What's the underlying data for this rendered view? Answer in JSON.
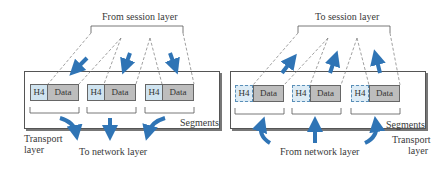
{
  "left_panel": {
    "top_label": "From session layer",
    "bottom_label": "To network layer",
    "segments_label": "Segments",
    "layer_label_line1": "Transport",
    "layer_label_line2": "layer",
    "segments": [
      {
        "header": "H4",
        "data": "Data"
      },
      {
        "header": "H4",
        "data": "Data"
      },
      {
        "header": "H4",
        "data": "Data"
      }
    ]
  },
  "right_panel": {
    "top_label": "To session layer",
    "bottom_label": "From network layer",
    "segments_label": "Segments",
    "layer_label_line1": "Transport",
    "layer_label_line2": "layer",
    "segments": [
      {
        "header": "H4",
        "data": "Data"
      },
      {
        "header": "H4",
        "data": "Data"
      },
      {
        "header": "H4",
        "data": "Data"
      }
    ]
  },
  "colors": {
    "arrow": "#2f74b5",
    "header_fill": "#cfe3ef",
    "data_fill": "#bdbdbd"
  }
}
